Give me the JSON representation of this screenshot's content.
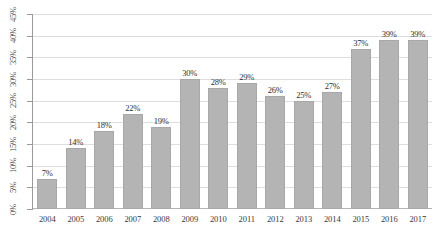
{
  "chart_data": {
    "type": "bar",
    "title": "",
    "subtitle": "",
    "xlabel": "",
    "ylabel": "",
    "categories": [
      "2004",
      "2005",
      "2006",
      "2007",
      "2008",
      "2009",
      "2010",
      "2011",
      "2012",
      "2013",
      "2014",
      "2015",
      "2016",
      "2017"
    ],
    "values": [
      7,
      14,
      18,
      22,
      19,
      30,
      28,
      29,
      26,
      25,
      27,
      37,
      39,
      39
    ],
    "value_labels": [
      "7%",
      "14%",
      "18%",
      "22%",
      "19%",
      "30%",
      "28%",
      "29%",
      "26%",
      "25%",
      "27%",
      "37%",
      "39%",
      "39%"
    ],
    "ylim": [
      0,
      45
    ],
    "ytick_values": [
      0,
      5,
      10,
      15,
      20,
      25,
      30,
      35,
      40,
      45
    ],
    "ytick_labels": [
      "0%",
      "5%",
      "10%",
      "15%",
      "20%",
      "25%",
      "30%",
      "35%",
      "40%",
      "45%"
    ],
    "grid": true,
    "grid_axis": "y",
    "legend": false,
    "legend_position": "none",
    "bar_color": "#b4b4b4",
    "gridline_color": "#dedede",
    "axis_color": "#9a9a9a",
    "text_color": "#3a3a3a",
    "background_color": "#ffffff",
    "ytick_label_rotation": 90
  }
}
